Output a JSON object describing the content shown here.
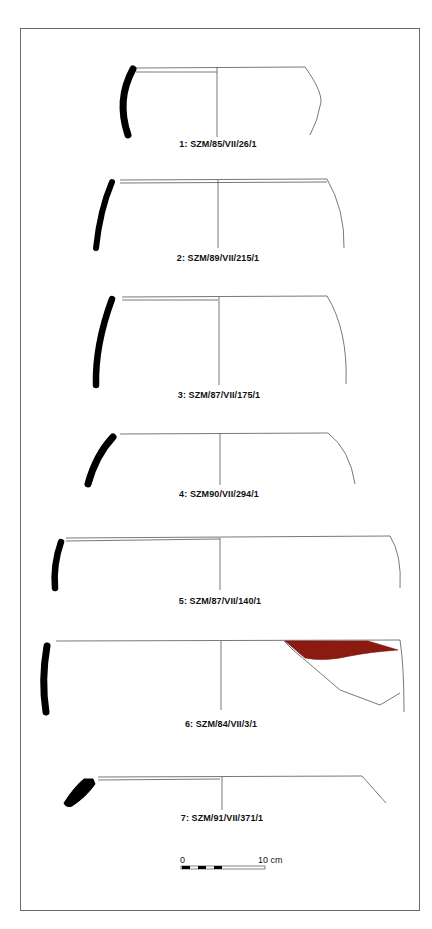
{
  "figure": {
    "type": "pottery profile drawings plate",
    "vessels": [
      {
        "number": 1,
        "label": "1: SZM/85/VII/26/1"
      },
      {
        "number": 2,
        "label": "2: SZM/89/VII/215/1"
      },
      {
        "number": 3,
        "label": "3: SZM/87/VII/175/1"
      },
      {
        "number": 4,
        "label": "4: SZM90/VII/294/1"
      },
      {
        "number": 5,
        "label": "5: SZM/87/VII/140/1"
      },
      {
        "number": 6,
        "label": "6: SZM/84/VII/3/1",
        "painted_decoration_color": "#8b1a10"
      },
      {
        "number": 7,
        "label": "7: SZM/91/VII/371/1"
      }
    ],
    "scale_bar": {
      "start_label": "0",
      "end_label": "10 cm"
    },
    "colors": {
      "section_fill": "#000000",
      "outline": "#555555",
      "paint": "#8b1a10",
      "frame": "#6a6a6a"
    }
  }
}
